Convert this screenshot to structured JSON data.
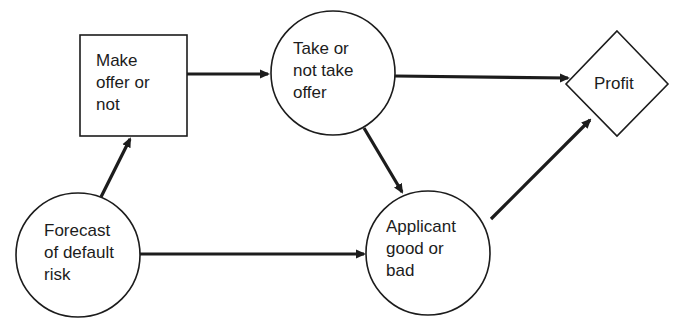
{
  "diagram": {
    "type": "influence-diagram",
    "colors": {
      "stroke": "#1c1c1c",
      "background": "#ffffff"
    },
    "nodes": [
      {
        "id": "make_offer",
        "shape": "rectangle",
        "role": "decision",
        "label": "Make\noffer or\nnot"
      },
      {
        "id": "take_offer",
        "shape": "circle",
        "role": "chance",
        "label": "Take or\nnot take\noffer"
      },
      {
        "id": "profit",
        "shape": "diamond",
        "role": "value",
        "label": "Profit"
      },
      {
        "id": "forecast",
        "shape": "circle",
        "role": "chance",
        "label": "Forecast\nof default\nrisk"
      },
      {
        "id": "applicant",
        "shape": "circle",
        "role": "chance",
        "label": "Applicant\ngood or\nbad"
      }
    ],
    "edges": [
      {
        "from": "forecast",
        "to": "make_offer"
      },
      {
        "from": "make_offer",
        "to": "take_offer"
      },
      {
        "from": "take_offer",
        "to": "profit"
      },
      {
        "from": "take_offer",
        "to": "applicant"
      },
      {
        "from": "forecast",
        "to": "applicant"
      },
      {
        "from": "applicant",
        "to": "profit"
      }
    ]
  },
  "labels": {
    "make_offer": "Make\noffer or\nnot",
    "take_offer": "Take or\nnot take\noffer",
    "profit": "Profit",
    "forecast": "Forecast\nof default\nrisk",
    "applicant": "Applicant\ngood or\nbad"
  }
}
